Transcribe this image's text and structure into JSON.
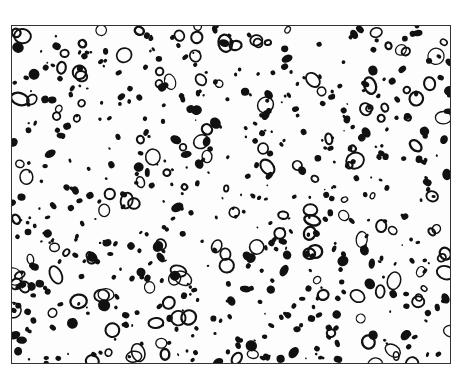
{
  "image": {
    "description": "Black-and-white micrograph showing dispersed particles, rings and blobs within a rectangular frame",
    "frame": {
      "x": 11,
      "y": 25,
      "width": 440,
      "height": 339
    },
    "colors": {
      "background": "#fdfdfd",
      "ink": "#111111",
      "border": "#333333"
    },
    "particles": {
      "filled_count": 520,
      "ring_count": 150,
      "seed": 7
    }
  }
}
